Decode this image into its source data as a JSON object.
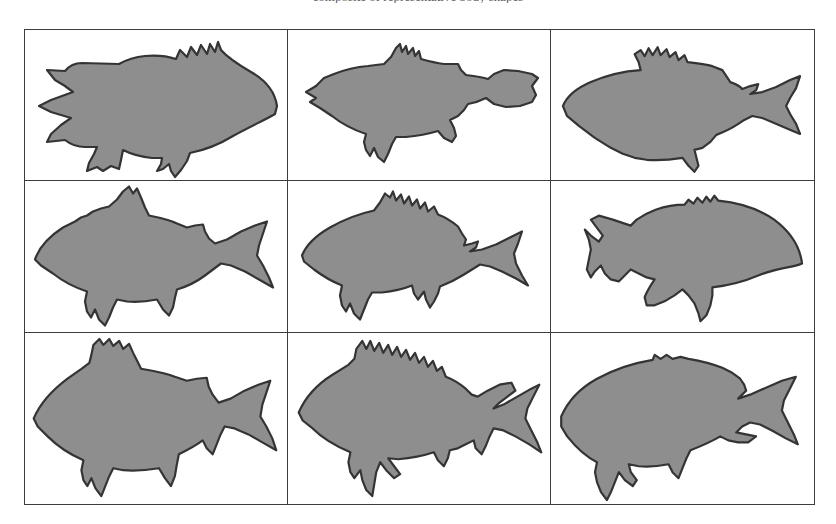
{
  "page": {
    "background_color": "#ffffff",
    "clipped_caption": "composite of representative body shapes"
  },
  "figure": {
    "name": "fish-silhouette-plate",
    "frame_color": "#3d3d3d",
    "cell_background": "#ffffff",
    "silhouette_fill": "#8e8e8e",
    "silhouette_outline": "#343434",
    "rows": 3,
    "columns": 3,
    "cells": [
      {
        "index": 1,
        "row": 1,
        "column": 1,
        "label": "fish-silhouette-1",
        "facing": "right",
        "body_shape": "deep-bodied rockfish with spiny dorsal ridge and forked caudal fin",
        "tail_side": "left"
      },
      {
        "index": 2,
        "row": 1,
        "column": 2,
        "label": "fish-silhouette-2",
        "facing": "left",
        "body_shape": "elongated fusiform body with low dorsal notch and rounded caudal fin",
        "tail_side": "right"
      },
      {
        "index": 3,
        "row": 1,
        "column": 3,
        "label": "fish-silhouette-3",
        "facing": "left",
        "body_shape": "streamlined body with serrated dorsal margin and deeply forked tail",
        "tail_side": "right"
      },
      {
        "index": 4,
        "row": 2,
        "column": 1,
        "label": "fish-silhouette-4",
        "facing": "left",
        "body_shape": "arched-back body with tall triangular dorsal fin and forked tail",
        "tail_side": "right"
      },
      {
        "index": 5,
        "row": 2,
        "column": 2,
        "label": "fish-silhouette-5",
        "facing": "left",
        "body_shape": "bass-like body with spiny first dorsal and soft second dorsal",
        "tail_side": "right"
      },
      {
        "index": 6,
        "row": 2,
        "column": 3,
        "label": "fish-silhouette-6",
        "facing": "right",
        "body_shape": "very deep compressed body, sunfish-like, short caudal peduncle",
        "tail_side": "left"
      },
      {
        "index": 7,
        "row": 3,
        "column": 1,
        "label": "fish-silhouette-7",
        "facing": "left",
        "body_shape": "deep rhomboid body with large forked caudal fin",
        "tail_side": "right"
      },
      {
        "index": 8,
        "row": 3,
        "column": 2,
        "label": "fish-silhouette-8",
        "facing": "left",
        "body_shape": "spiny-dorsal body with elongated pelvic fin rays and forked tail",
        "tail_side": "right"
      },
      {
        "index": 9,
        "row": 3,
        "column": 3,
        "label": "fish-silhouette-9",
        "facing": "left",
        "body_shape": "snapper-like body with smooth dorsal profile and forked tail",
        "tail_side": "right"
      }
    ]
  }
}
